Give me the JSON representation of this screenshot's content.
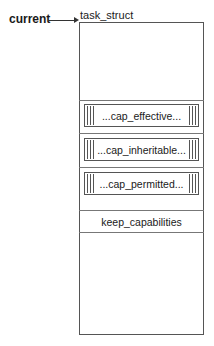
{
  "pointer": {
    "label": "current",
    "target": "task_struct"
  },
  "struct": {
    "name": "task_struct",
    "fields": [
      {
        "label": "...cap_effective..."
      },
      {
        "label": "...cap_inheritable..."
      },
      {
        "label": "...cap_permitted..."
      },
      {
        "label": "keep_capabilities"
      }
    ]
  }
}
